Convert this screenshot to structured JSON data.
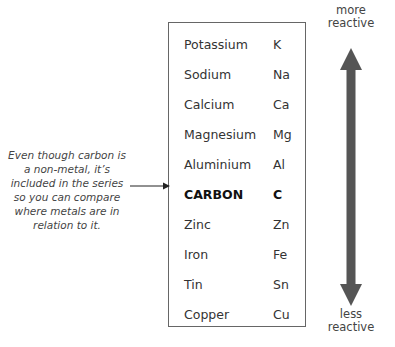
{
  "diagram": {
    "rows": [
      {
        "name": "Potassium",
        "symbol": "K",
        "bold": false
      },
      {
        "name": "Sodium",
        "symbol": "Na",
        "bold": false
      },
      {
        "name": "Calcium",
        "symbol": "Ca",
        "bold": false
      },
      {
        "name": "Magnesium",
        "symbol": "Mg",
        "bold": false
      },
      {
        "name": "Aluminium",
        "symbol": "Al",
        "bold": false
      },
      {
        "name": "CARBON",
        "symbol": "C",
        "bold": true
      },
      {
        "name": "Zinc",
        "symbol": "Zn",
        "bold": false
      },
      {
        "name": "Iron",
        "symbol": "Fe",
        "bold": false
      },
      {
        "name": "Tin",
        "symbol": "Sn",
        "bold": false
      },
      {
        "name": "Copper",
        "symbol": "Cu",
        "bold": false
      }
    ],
    "note": "Even though carbon is a non-metal, it’s included in the series so you can compare where metals are in relation to it.",
    "scale": {
      "top_label": "more reactive",
      "top_line1": "more",
      "top_line2": "reactive",
      "bottom_label": "less reactive",
      "bottom_line1": "less",
      "bottom_line2": "reactive",
      "arrow_color": "#555555"
    }
  }
}
